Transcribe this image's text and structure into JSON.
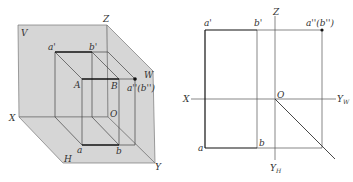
{
  "figure_left": {
    "title": "Three-plane projection system (axonometric view)",
    "planes": {
      "V": "V",
      "H": "H",
      "W": "W"
    },
    "axes": {
      "x": "X",
      "y": "Y",
      "z": "Z",
      "origin": "O"
    },
    "points": {
      "A": "A",
      "B": "B",
      "a_prime": "a'",
      "b_prime": "b'",
      "a": "a",
      "b": "b",
      "a_dprime": "a''(b'')"
    },
    "colors": {
      "plane_fill": "#d9d9d9",
      "line": "#333333",
      "thick_line": "#111111"
    }
  },
  "figure_right": {
    "title": "Orthographic projection unfolded",
    "axes": {
      "x": "X",
      "z": "Z",
      "origin": "O",
      "yw": "Y",
      "yw_sub": "W",
      "yh": "Y",
      "yh_sub": "H"
    },
    "points": {
      "a_prime": "a'",
      "b_prime": "b'",
      "a": "a",
      "b": "b",
      "a_dprime": "a''(b'')"
    }
  }
}
